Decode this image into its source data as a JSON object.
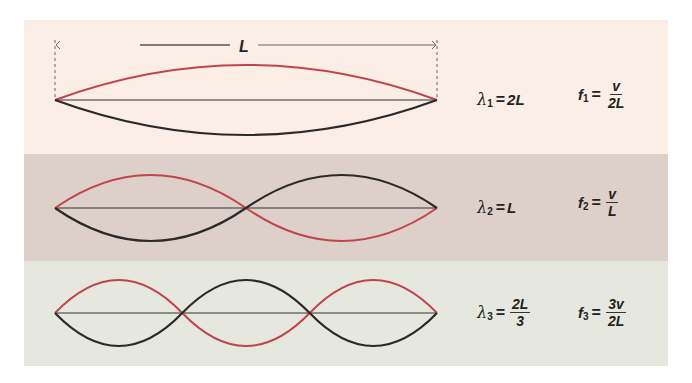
{
  "colors": {
    "band1_bg": "#fbeee6",
    "band2_bg": "#ddd0ca",
    "band3_bg": "#e6e8df",
    "wave_red": "#c0454a",
    "wave_black": "#2a2a2a",
    "string": "#333333"
  },
  "dimension": {
    "label": "L"
  },
  "modes": [
    {
      "n": 1,
      "wavelength": {
        "symbol": "λ",
        "sub": "1",
        "eq": "=",
        "value": "2L"
      },
      "frequency": {
        "symbol": "f",
        "sub": "1",
        "eq": "=",
        "num": "v",
        "den": "2L"
      }
    },
    {
      "n": 2,
      "wavelength": {
        "symbol": "λ",
        "sub": "2",
        "eq": "=",
        "value": "L"
      },
      "frequency": {
        "symbol": "f",
        "sub": "2",
        "eq": "=",
        "num": "v",
        "den": "L"
      }
    },
    {
      "n": 3,
      "wavelength": {
        "symbol": "λ",
        "sub": "3",
        "eq": "=",
        "num": "2L",
        "den": "3"
      },
      "frequency": {
        "symbol": "f",
        "sub": "3",
        "eq": "=",
        "num": "3v",
        "den": "2L"
      }
    }
  ]
}
